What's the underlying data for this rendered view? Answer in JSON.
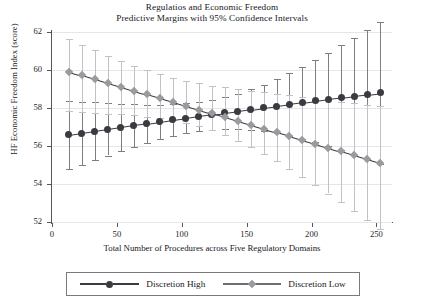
{
  "chart_data": {
    "type": "line",
    "title": "Regulatios and Economic Freedom",
    "subtitle": "Predictive Margins with 95% Confidence Intervals",
    "xlabel": "Total Number of Procedures across Five Regulatory Domains",
    "ylabel": "HF Economic Freedom Index (score)",
    "xlim": [
      0,
      262
    ],
    "ylim": [
      52,
      62
    ],
    "xticks": [
      0,
      50,
      100,
      150,
      200,
      250
    ],
    "xtick_labels": [
      "0",
      "50",
      "100",
      "150",
      "200",
      "250"
    ],
    "yticks": [
      52,
      54,
      56,
      58,
      60,
      62
    ],
    "ytick_labels": [
      "52",
      "54",
      "56",
      "58",
      "60",
      "62"
    ],
    "grid": "horizontal",
    "legend_position": "bottom",
    "x": [
      13,
      23,
      33,
      43,
      53,
      63,
      73,
      83,
      93,
      103,
      113,
      123,
      133,
      143,
      153,
      163,
      173,
      183,
      193,
      203,
      213,
      223,
      233,
      243,
      253
    ],
    "series": [
      {
        "name": "Discretion High",
        "marker": "circle",
        "color": "#3a3a40",
        "values": [
          56.58,
          56.68,
          56.78,
          56.88,
          56.98,
          57.08,
          57.17,
          57.27,
          57.37,
          57.46,
          57.56,
          57.65,
          57.74,
          57.83,
          57.92,
          58.01,
          58.1,
          58.19,
          58.28,
          58.37,
          58.46,
          58.54,
          58.63,
          58.71,
          58.79
        ],
        "ci_low": [
          54.78,
          55.02,
          55.26,
          55.5,
          55.74,
          55.97,
          56.18,
          56.37,
          56.54,
          56.68,
          56.79,
          56.86,
          56.9,
          56.9,
          56.86,
          56.79,
          56.68,
          56.54,
          56.38,
          56.2,
          56.0,
          55.78,
          55.55,
          55.31,
          55.06
        ],
        "ci_high": [
          58.38,
          58.34,
          58.3,
          58.26,
          58.22,
          58.19,
          58.16,
          58.17,
          58.2,
          58.24,
          58.33,
          58.44,
          58.58,
          58.76,
          58.98,
          59.23,
          59.52,
          59.84,
          60.18,
          60.54,
          60.92,
          61.3,
          61.71,
          62.11,
          62.52
        ]
      },
      {
        "name": "Discretion Low",
        "marker": "diamond",
        "color": "#9a9a9f",
        "values": [
          59.92,
          59.72,
          59.52,
          59.32,
          59.12,
          58.92,
          58.72,
          58.52,
          58.32,
          58.12,
          57.92,
          57.72,
          57.52,
          57.32,
          57.12,
          56.92,
          56.72,
          56.52,
          56.32,
          56.12,
          55.92,
          55.72,
          55.52,
          55.32,
          55.12
        ],
        "ci_low": [
          57.82,
          57.78,
          57.74,
          57.7,
          57.66,
          57.61,
          57.55,
          57.47,
          57.36,
          57.22,
          57.04,
          56.82,
          56.56,
          56.26,
          55.94,
          55.58,
          55.2,
          54.8,
          54.38,
          53.95,
          53.5,
          53.05,
          52.58,
          52.11,
          51.63
        ],
        "ci_high": [
          61.62,
          61.32,
          61.03,
          60.75,
          60.48,
          60.23,
          60.0,
          59.79,
          59.6,
          59.44,
          59.3,
          59.18,
          59.08,
          58.98,
          58.9,
          58.82,
          58.74,
          58.66,
          58.58,
          58.5,
          58.42,
          58.34,
          58.26,
          58.18,
          58.1
        ]
      }
    ]
  },
  "legend": {
    "entries": [
      {
        "label": "Discretion High"
      },
      {
        "label": "Discretion Low"
      }
    ]
  }
}
